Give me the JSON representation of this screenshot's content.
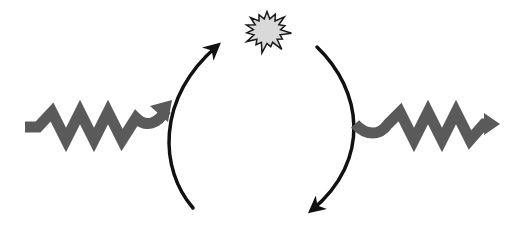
{
  "diagram": {
    "colors": {
      "wave": "#5a5a5a",
      "arc": "#111111",
      "star_fill": "#d9d9d9",
      "star_stroke": "#1a1a1a",
      "background": "#ffffff"
    },
    "elements": [
      {
        "id": "incoming-wave",
        "kind": "wavy-arrow",
        "direction": "into-cycle"
      },
      {
        "id": "left-arc",
        "kind": "curved-arrow",
        "direction": "upward"
      },
      {
        "id": "star-burst",
        "kind": "star"
      },
      {
        "id": "right-arc",
        "kind": "curved-arrow",
        "direction": "downward"
      },
      {
        "id": "outgoing-wave",
        "kind": "wavy-arrow",
        "direction": "out-of-cycle"
      }
    ],
    "labels": []
  }
}
